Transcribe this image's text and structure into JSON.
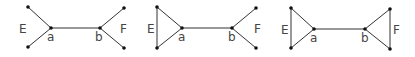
{
  "diagrams": [
    {
      "name": "graph-1",
      "labels": {
        "E": "E",
        "a": "a",
        "b": "b",
        "F": "F"
      },
      "nodes": [
        [
          28,
          7
        ],
        [
          28,
          47
        ],
        [
          51,
          28
        ],
        [
          100,
          28
        ],
        [
          124,
          8
        ],
        [
          124,
          48
        ]
      ],
      "edges": [
        [
          0,
          2
        ],
        [
          1,
          2
        ],
        [
          2,
          3
        ],
        [
          3,
          4
        ],
        [
          3,
          5
        ]
      ]
    },
    {
      "name": "graph-2",
      "labels": {
        "E": "E",
        "a": "a",
        "b": "b",
        "F": "F"
      },
      "nodes": [
        [
          157,
          7
        ],
        [
          157,
          48
        ],
        [
          182,
          28
        ],
        [
          232,
          28
        ],
        [
          256,
          8
        ],
        [
          256,
          48
        ]
      ],
      "edges": [
        [
          0,
          1
        ],
        [
          0,
          2
        ],
        [
          1,
          2
        ],
        [
          2,
          3
        ],
        [
          3,
          4
        ],
        [
          3,
          5
        ]
      ]
    },
    {
      "name": "graph-3",
      "labels": {
        "E": "E",
        "a": "a",
        "b": "b",
        "F": "F"
      },
      "nodes": [
        [
          291,
          8
        ],
        [
          291,
          48
        ],
        [
          314,
          29
        ],
        [
          365,
          29
        ],
        [
          390,
          9
        ],
        [
          390,
          49
        ]
      ],
      "edges": [
        [
          0,
          1
        ],
        [
          0,
          2
        ],
        [
          1,
          2
        ],
        [
          2,
          3
        ],
        [
          3,
          4
        ],
        [
          3,
          5
        ],
        [
          4,
          5
        ]
      ]
    }
  ],
  "colors": {
    "edge": "#333333",
    "node": "#111111",
    "label": "#444444"
  }
}
